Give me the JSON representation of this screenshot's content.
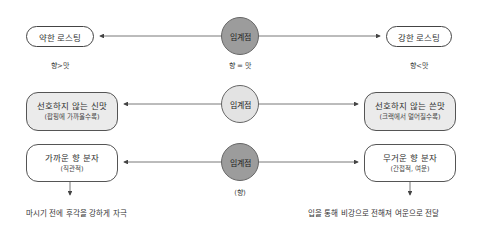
{
  "rows": [
    {
      "center": {
        "label": "임계점",
        "caption": "향 = 맛",
        "style": "dark"
      },
      "left": {
        "title": "약한 로스팅",
        "caption": "향>맛"
      },
      "right": {
        "title": "강한 로스팅",
        "caption": "향<맛"
      }
    },
    {
      "center": {
        "label": "임계점",
        "style": "light"
      },
      "left": {
        "title": "선호하지 않는 신맛",
        "subtitle": "(팝핑에 가까울수록)"
      },
      "right": {
        "title": "선호하지 않는 쓴맛",
        "subtitle": "(크랙에서 멀어질수록)"
      }
    },
    {
      "center": {
        "label": "임계점",
        "caption": "(향)",
        "style": "dark"
      },
      "left": {
        "title": "가까운 향 분자",
        "subtitle": "(직관적)",
        "note": "마시기 전에 후각을 강하게 자극"
      },
      "right": {
        "title": "무거운 향 분자",
        "subtitle": "(간접적, 여운)",
        "note": "입을 통해 비강으로 전해져 여운으로 전달"
      }
    }
  ],
  "colors": {
    "dark_circle": "#9c9c9c",
    "light_circle": "#e3e3e3",
    "gray_box": "#ebebeb",
    "line": "#444444"
  }
}
